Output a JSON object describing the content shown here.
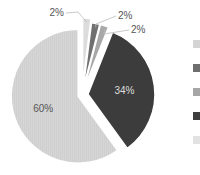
{
  "chart_data": {
    "type": "pie",
    "title": "",
    "categories": [
      "Category 1",
      "Category 2",
      "Category 3",
      "Category 4",
      "Category 5"
    ],
    "values": [
      2,
      2,
      2,
      34,
      60
    ],
    "labels": [
      "2%",
      "2%",
      "2%",
      "34%",
      "60%"
    ],
    "colors": [
      "#dcdcdc",
      "#707070",
      "#a8a8a8",
      "#3c3c3c",
      "#d6d6d6"
    ],
    "legend_position": "right",
    "start_angle_deg": 0,
    "direction": "clockwise",
    "exploded": true
  },
  "legend": {
    "items": [
      {
        "color": "#d4d4d4",
        "label": ""
      },
      {
        "color": "#6e6e6e",
        "label": ""
      },
      {
        "color": "#a6a6a6",
        "label": ""
      },
      {
        "color": "#3e3e3e",
        "label": ""
      },
      {
        "color": "#e2e2e2",
        "label": ""
      }
    ]
  }
}
